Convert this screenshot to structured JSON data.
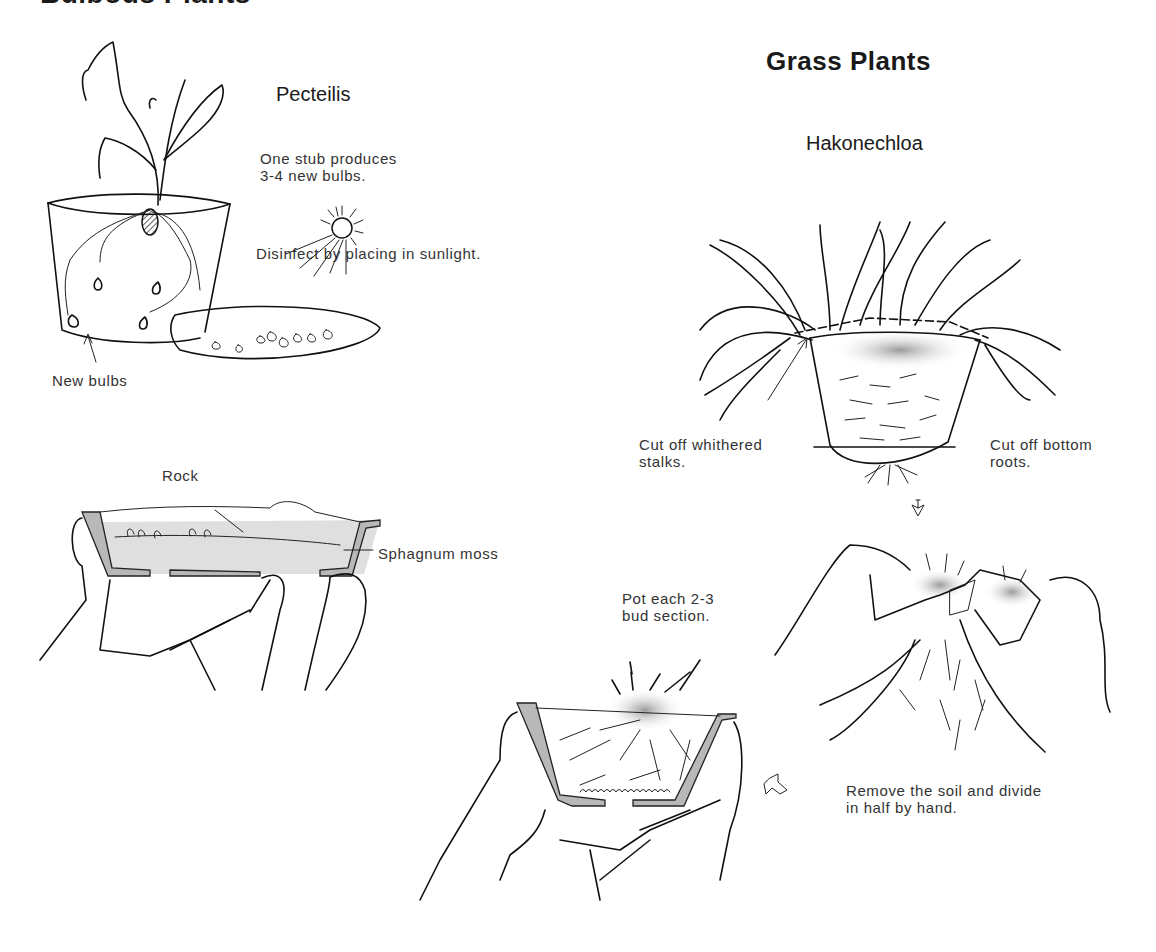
{
  "sections": {
    "bulbous": {
      "title": "Bulbous Plants",
      "plant_name": "Pecteilis",
      "captions": {
        "stub": "One stub produces\n3-4 new bulbs.",
        "sunlight": "Disinfect by placing in sunlight.",
        "new_bulbs": "New bulbs",
        "rock": "Rock",
        "sphagnum": "Sphagnum moss"
      }
    },
    "grass": {
      "title": "Grass Plants",
      "plant_name": "Hakonechloa",
      "captions": {
        "cut_stalks": "Cut off whithered\nstalks.",
        "cut_roots": "Cut off bottom\nroots.",
        "remove_soil": "Remove the soil and divide\nin half by hand.",
        "pot_each": "Pot each 2-3\nbud section."
      }
    }
  },
  "icons": {
    "arrow_down": "hand-drawn-down-arrow",
    "arrow_down_left": "hand-drawn-down-left-arrow",
    "sun": "sun-icon"
  },
  "colors": {
    "ink": "#111111",
    "text": "#333333",
    "shading": "#b8b8b8",
    "background": "#ffffff"
  }
}
